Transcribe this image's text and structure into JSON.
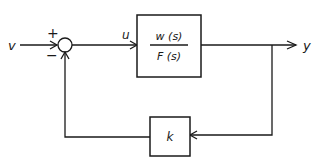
{
  "diagram": {
    "type": "feedback-control-block-diagram",
    "input_label": "v",
    "control_label": "u",
    "output_label": "y",
    "summing_junction": {
      "plus_sign": "+",
      "minus_sign": "−"
    },
    "forward_block": {
      "numerator": "w (s)",
      "denominator": "F (s)"
    },
    "feedback_block": {
      "label": "k"
    },
    "colors": {
      "line": "#1a1a1a",
      "background": "#ffffff"
    }
  }
}
